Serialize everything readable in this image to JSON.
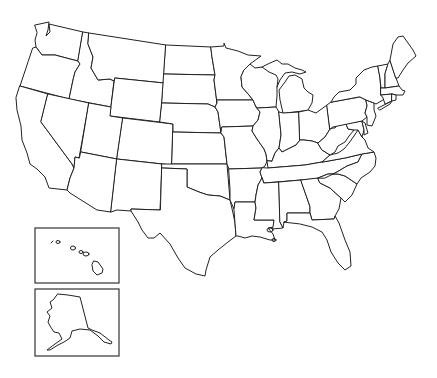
{
  "map": {
    "title": "United States outline map",
    "type": "blank state outline map",
    "background_color": "#ffffff",
    "stroke_color": "#222222",
    "labels_visible": false,
    "insets": [
      {
        "name": "Hawaii",
        "box": [
          35,
          228,
          119,
          283
        ]
      },
      {
        "name": "Alaska",
        "box": [
          35,
          289,
          119,
          356
        ]
      }
    ],
    "states": [
      "Washington",
      "Oregon",
      "California",
      "Idaho",
      "Nevada",
      "Montana",
      "Wyoming",
      "Utah",
      "Arizona",
      "Colorado",
      "New Mexico",
      "North Dakota",
      "South Dakota",
      "Nebraska",
      "Kansas",
      "Oklahoma",
      "Texas",
      "Minnesota",
      "Iowa",
      "Missouri",
      "Arkansas",
      "Louisiana",
      "Wisconsin",
      "Illinois",
      "Michigan",
      "Indiana",
      "Ohio",
      "Kentucky",
      "Tennessee",
      "Mississippi",
      "Alabama",
      "Georgia",
      "Florida",
      "South Carolina",
      "North Carolina",
      "Virginia",
      "West Virginia",
      "Maryland",
      "Delaware",
      "Pennsylvania",
      "New Jersey",
      "New York",
      "Connecticut",
      "Rhode Island",
      "Massachusetts",
      "Vermont",
      "New Hampshire",
      "Maine",
      "Alaska",
      "Hawaii"
    ]
  }
}
